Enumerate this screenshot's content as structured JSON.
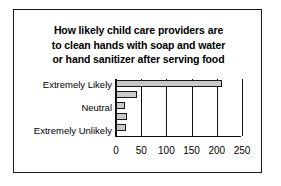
{
  "chart_data": {
    "type": "bar",
    "orientation": "horizontal",
    "title": "How likely child care providers are to clean hands with soap and water or hand sanitizer after serving food",
    "title_lines": [
      "How likely child care providers are",
      "to clean hands with soap and water",
      "or hand sanitizer after serving food"
    ],
    "categories": [
      "Extremely Likely",
      "",
      "Neutral",
      "",
      "Extremely Unlikely"
    ],
    "category_labels_visible": [
      "Extremely Likely",
      "Neutral",
      "Extremely Unlikely"
    ],
    "values": [
      210,
      42,
      18,
      22,
      20
    ],
    "xlabel": "",
    "ylabel": "",
    "xlim": [
      0,
      250
    ],
    "xticks": [
      0,
      50,
      100,
      150,
      200,
      250
    ],
    "xtick_labels": [
      "0",
      "50",
      "100",
      "150",
      "200",
      "250"
    ],
    "grid": true,
    "grid_axis": "x",
    "legend": false,
    "bar_fill_color": "#c9c9c9",
    "bar_edge_color": "#1a1a1a",
    "axis_color": "#111111",
    "background_color": "#ffffff",
    "frame_border_color": "#1a1a1a"
  }
}
